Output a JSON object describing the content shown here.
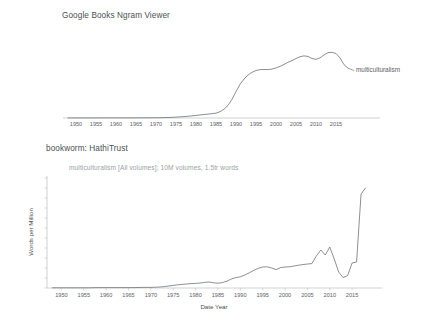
{
  "page": {
    "background": "#ffffff",
    "line_color": "#6e7277",
    "axis_color": "#b9bdc1",
    "text_color": "#5b6065"
  },
  "charts": [
    {
      "id": "ngram",
      "title": "Google Books Ngram Viewer",
      "series_label": "multiculturalism"
    },
    {
      "id": "bookworm",
      "title": "bookworm: HathiTrust",
      "subtitle": "multiculturalism [All volumes]; 10M volumes, 1.5tr words",
      "ylabel": "Words per Million",
      "xlabel": "Date Year"
    }
  ],
  "chart_data": [
    {
      "type": "line",
      "title": "Google Books Ngram Viewer",
      "xlabel": "",
      "ylabel": "",
      "legend": [
        "multiculturalism"
      ],
      "legend_position": "right-inline",
      "grid": false,
      "xlim": [
        1947,
        2019
      ],
      "ylim": [
        0.0,
        0.00029
      ],
      "xticks": [
        1950,
        1955,
        1960,
        1965,
        1970,
        1975,
        1980,
        1985,
        1990,
        1995,
        2000,
        2005,
        2010,
        2015
      ],
      "yticks": [
        "0.00000%",
        "0.00002%",
        "0.00004%",
        "0.00006%",
        "0.00008%",
        "0.00010%",
        "0.00012%",
        "0.00014%",
        "0.00016%",
        "0.00018%",
        "0.00020%",
        "0.00022%",
        "0.00024%",
        "0.00026%",
        "0.00028%"
      ],
      "ytick_values": [
        0.0,
        2e-05,
        4e-05,
        6e-05,
        8e-05,
        0.0001,
        0.00012,
        0.00014,
        0.00016,
        0.00018,
        0.0002,
        0.00022,
        0.00024,
        0.00026,
        0.00028
      ],
      "yunit": "percent of all words",
      "series": [
        {
          "name": "multiculturalism",
          "x": [
            1948,
            1950,
            1952,
            1954,
            1956,
            1958,
            1960,
            1962,
            1964,
            1966,
            1968,
            1970,
            1971,
            1972,
            1973,
            1974,
            1975,
            1976,
            1977,
            1978,
            1979,
            1980,
            1981,
            1982,
            1983,
            1984,
            1985,
            1986,
            1987,
            1988,
            1989,
            1990,
            1991,
            1992,
            1993,
            1994,
            1995,
            1996,
            1997,
            1998,
            1999,
            2000,
            2001,
            2002,
            2003,
            2004,
            2005,
            2006,
            2007,
            2008,
            2009,
            2010,
            2011,
            2012,
            2013,
            2014,
            2015,
            2016,
            2017,
            2018
          ],
          "values": [
            3e-07,
            3e-07,
            3e-07,
            3e-07,
            4e-07,
            4e-07,
            4e-07,
            5e-07,
            5e-07,
            6e-07,
            7e-07,
            9e-07,
            1.1e-06,
            1.4e-06,
            1.8e-06,
            2.3e-06,
            3e-06,
            3.8e-06,
            4.8e-06,
            6e-06,
            7.3e-06,
            8.8e-06,
            1.03e-05,
            1.18e-05,
            1.33e-05,
            1.48e-05,
            1.65e-05,
            2.15e-05,
            3e-05,
            4.3e-05,
            6.4e-05,
            9e-05,
            0.000115,
            0.000133,
            0.0001465,
            0.000156,
            0.000162,
            0.000165,
            0.0001655,
            0.000165,
            0.000167,
            0.000171,
            0.000176,
            0.000183,
            0.00019,
            0.000196,
            0.000203,
            0.000209,
            0.000212,
            0.00021,
            0.000203,
            0.0002,
            0.000205,
            0.000215,
            0.000223,
            0.000224,
            0.00022,
            0.000205,
            0.000182,
            0.00017
          ]
        }
      ]
    },
    {
      "type": "line",
      "title": "bookworm: HathiTrust",
      "subtitle": "multiculturalism [All volumes]; 10M volumes, 1.5tr words",
      "xlabel": "Date Year",
      "ylabel": "Words per Million",
      "grid": false,
      "xlim": [
        1947,
        2019
      ],
      "ylim": [
        0.0,
        5.6
      ],
      "xticks": [
        1950,
        1955,
        1960,
        1965,
        1970,
        1975,
        1980,
        1985,
        1990,
        1995,
        2000,
        2005,
        2010,
        2015
      ],
      "yticks": [
        "0.0",
        "0.5",
        "1.0",
        "1.5",
        "2.0",
        "2.5",
        "3.0",
        "3.5",
        "4.0",
        "4.5",
        "5.0",
        "5.5"
      ],
      "ytick_values": [
        0.0,
        0.5,
        1.0,
        1.5,
        2.0,
        2.5,
        3.0,
        3.5,
        4.0,
        4.5,
        5.0,
        5.5
      ],
      "series": [
        {
          "name": "multiculturalism [All volumes]",
          "x": [
            1948,
            1950,
            1952,
            1954,
            1956,
            1958,
            1960,
            1962,
            1964,
            1966,
            1968,
            1970,
            1971,
            1972,
            1973,
            1974,
            1975,
            1976,
            1977,
            1978,
            1979,
            1980,
            1981,
            1982,
            1983,
            1984,
            1985,
            1986,
            1987,
            1988,
            1989,
            1990,
            1991,
            1992,
            1993,
            1994,
            1995,
            1996,
            1997,
            1998,
            1999,
            2000,
            2001,
            2002,
            2003,
            2004,
            2005,
            2006,
            2007,
            2008,
            2009,
            2010,
            2011,
            2012,
            2013,
            2014,
            2015,
            2016,
            2017,
            2018
          ],
          "values": [
            0.01,
            0.01,
            0.01,
            0.01,
            0.01,
            0.02,
            0.02,
            0.02,
            0.02,
            0.02,
            0.03,
            0.03,
            0.04,
            0.05,
            0.07,
            0.1,
            0.13,
            0.16,
            0.18,
            0.2,
            0.22,
            0.23,
            0.25,
            0.28,
            0.3,
            0.26,
            0.24,
            0.27,
            0.34,
            0.45,
            0.52,
            0.56,
            0.65,
            0.76,
            0.88,
            0.98,
            1.05,
            1.06,
            1.0,
            0.92,
            1.02,
            1.05,
            1.06,
            1.1,
            1.14,
            1.17,
            1.2,
            1.22,
            1.6,
            1.9,
            1.65,
            2.05,
            1.45,
            0.8,
            0.52,
            0.62,
            1.25,
            1.3,
            4.7,
            5.0
          ]
        }
      ]
    }
  ]
}
